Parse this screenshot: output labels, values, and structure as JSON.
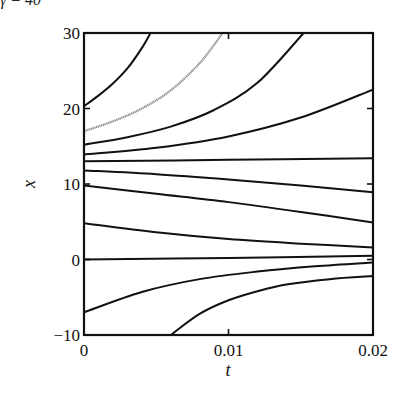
{
  "header_fragment": "γ = 40",
  "chart_data": {
    "type": "line",
    "title": "",
    "xlabel": "t",
    "ylabel": "x",
    "xlim": [
      0,
      0.02
    ],
    "ylim": [
      -10,
      30
    ],
    "xticks": [
      0,
      0.01,
      0.02
    ],
    "xtick_labels": [
      "0",
      "0.01",
      "0.02"
    ],
    "yticks": [
      -10,
      0,
      10,
      20,
      30
    ],
    "ytick_labels": [
      "−10",
      "0",
      "10",
      "20",
      "30"
    ],
    "grid": false,
    "legend": null,
    "series": [
      {
        "name": "x0=20.3",
        "color": "#111111",
        "x": [
          0,
          0.001,
          0.002,
          0.003,
          0.004,
          0.0046
        ],
        "y": [
          20.3,
          21.7,
          23.3,
          25.3,
          28.0,
          30.0
        ]
      },
      {
        "name": "x0=17.0 (gray)",
        "color": "#8a8a8a",
        "x": [
          0,
          0.002,
          0.004,
          0.006,
          0.008,
          0.0096
        ],
        "y": [
          17.0,
          18.3,
          20.0,
          22.4,
          26.0,
          30.0
        ]
      },
      {
        "name": "x0=15.2",
        "color": "#111111",
        "x": [
          0,
          0.003,
          0.006,
          0.009,
          0.012,
          0.0152
        ],
        "y": [
          15.2,
          16.2,
          17.6,
          19.8,
          23.4,
          30.0
        ]
      },
      {
        "name": "x0=13.9",
        "color": "#111111",
        "x": [
          0,
          0.005,
          0.01,
          0.015,
          0.02
        ],
        "y": [
          13.9,
          14.8,
          16.3,
          18.8,
          22.5
        ]
      },
      {
        "name": "x0=13.0",
        "color": "#111111",
        "x": [
          0,
          0.01,
          0.02
        ],
        "y": [
          13.0,
          13.2,
          13.4
        ]
      },
      {
        "name": "x0=11.8",
        "color": "#111111",
        "x": [
          0,
          0.005,
          0.01,
          0.015,
          0.02
        ],
        "y": [
          11.8,
          11.3,
          10.6,
          9.8,
          8.9
        ]
      },
      {
        "name": "x0=9.8",
        "color": "#111111",
        "x": [
          0,
          0.005,
          0.01,
          0.015,
          0.02
        ],
        "y": [
          9.8,
          8.7,
          7.6,
          6.3,
          4.9
        ]
      },
      {
        "name": "x0=4.8",
        "color": "#111111",
        "x": [
          0,
          0.005,
          0.01,
          0.015,
          0.02
        ],
        "y": [
          4.8,
          3.6,
          2.7,
          2.1,
          1.6
        ]
      },
      {
        "name": "x0=0",
        "color": "#111111",
        "x": [
          0,
          0.01,
          0.02
        ],
        "y": [
          0.0,
          0.2,
          0.5
        ]
      },
      {
        "name": "x0=-7",
        "color": "#111111",
        "x": [
          0,
          0.004,
          0.008,
          0.012,
          0.016,
          0.02
        ],
        "y": [
          -7.0,
          -4.3,
          -2.6,
          -1.6,
          -0.9,
          -0.4
        ]
      },
      {
        "name": "x0=-10 at t=0.006",
        "color": "#111111",
        "x": [
          0.006,
          0.008,
          0.01,
          0.012,
          0.014,
          0.017,
          0.02
        ],
        "y": [
          -10.0,
          -7.2,
          -5.4,
          -4.2,
          -3.3,
          -2.6,
          -2.2
        ]
      }
    ]
  }
}
